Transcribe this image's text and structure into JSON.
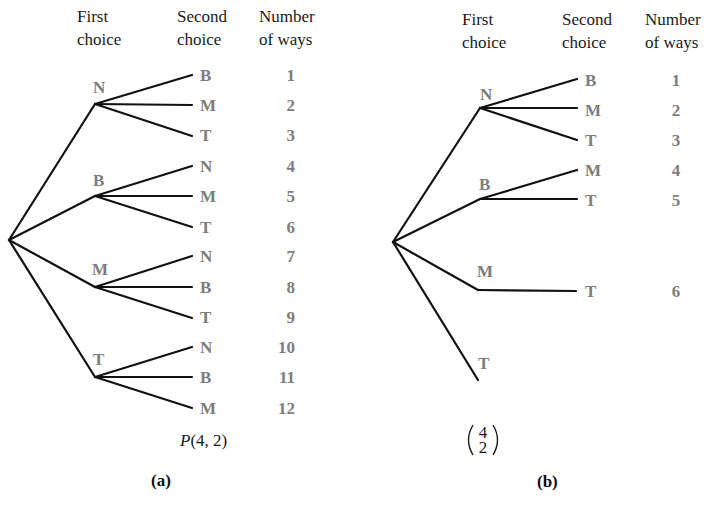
{
  "headers": {
    "first_line1": "First",
    "first_line2": "choice",
    "second_line1": "Second",
    "second_line2": "choice",
    "number_line1": "Number",
    "number_line2": "of ways"
  },
  "colors": {
    "label_text": "#7d7d7d",
    "edges": "#111111",
    "header_text": "#1a1a1a"
  },
  "tree_a": {
    "caption": "(a)",
    "formula": "P(4, 2)",
    "first_choices": [
      {
        "label": "N",
        "children": [
          {
            "label": "B",
            "way": "1"
          },
          {
            "label": "M",
            "way": "2"
          },
          {
            "label": "T",
            "way": "3"
          }
        ]
      },
      {
        "label": "B",
        "children": [
          {
            "label": "N",
            "way": "4"
          },
          {
            "label": "M",
            "way": "5"
          },
          {
            "label": "T",
            "way": "6"
          }
        ]
      },
      {
        "label": "M",
        "children": [
          {
            "label": "N",
            "way": "7"
          },
          {
            "label": "B",
            "way": "8"
          },
          {
            "label": "T",
            "way": "9"
          }
        ]
      },
      {
        "label": "T",
        "children": [
          {
            "label": "N",
            "way": "10"
          },
          {
            "label": "B",
            "way": "11"
          },
          {
            "label": "M",
            "way": "12"
          }
        ]
      }
    ]
  },
  "tree_b": {
    "caption": "(b)",
    "formula_top": "4",
    "formula_bottom": "2",
    "first_choices": [
      {
        "label": "N",
        "children": [
          {
            "label": "B",
            "way": "1"
          },
          {
            "label": "M",
            "way": "2"
          },
          {
            "label": "T",
            "way": "3"
          }
        ]
      },
      {
        "label": "B",
        "children": [
          {
            "label": "M",
            "way": "4"
          },
          {
            "label": "T",
            "way": "5"
          }
        ]
      },
      {
        "label": "M",
        "children": [
          {
            "label": "T",
            "way": "6"
          }
        ]
      },
      {
        "label": "T",
        "children": []
      }
    ]
  }
}
